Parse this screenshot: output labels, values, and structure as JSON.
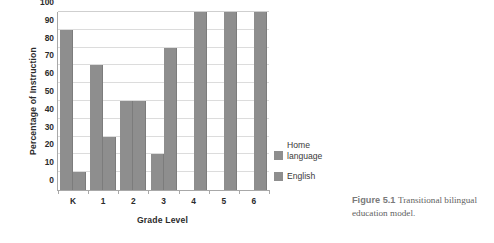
{
  "chart_data": {
    "type": "bar",
    "title": "",
    "xlabel": "Grade Level",
    "ylabel": "Percentage of Instruction",
    "categories": [
      "K",
      "1",
      "2",
      "3",
      "4",
      "5",
      "6"
    ],
    "series": [
      {
        "name": "Home language",
        "values": [
          90,
          70,
          50,
          20,
          0,
          0,
          0
        ]
      },
      {
        "name": "English",
        "values": [
          10,
          30,
          50,
          80,
          100,
          100,
          100
        ]
      }
    ],
    "ylim": [
      0,
      100
    ],
    "yticks": [
      0,
      10,
      20,
      30,
      40,
      50,
      60,
      70,
      80,
      90,
      100
    ],
    "ytick_labels": [
      "0",
      "10",
      "20",
      "30",
      "40",
      "50",
      "60",
      "70",
      "80",
      "90",
      "100"
    ],
    "grid": true,
    "grid_axis": "y",
    "legend_position": "right",
    "bar_color": "#8e8e8e"
  },
  "legend": {
    "entries": [
      {
        "line1": "Home",
        "line2": "language"
      },
      {
        "line1": "English",
        "line2": ""
      }
    ]
  },
  "caption": {
    "label": "Figure 5.1",
    "text": "Transitional bilingual education model."
  }
}
